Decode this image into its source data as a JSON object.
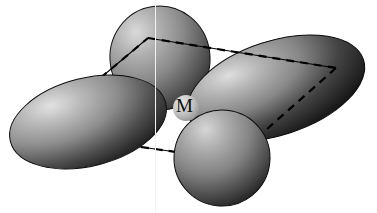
{
  "figure": {
    "kind": "3d-orbital-rendering",
    "background_color": "#ffffff",
    "center_atom_label": "M",
    "label_color": "#0d0d0d",
    "palette": {
      "lobe_highlight": "#d8d8d8",
      "lobe_midtone": "#8f8f8f",
      "lobe_shadow": "#2a2a2a",
      "lobe_deep_shadow": "#141414",
      "outline": "#000000",
      "dashed_line": "#000000",
      "solid_line": "#000000",
      "scanline": "#f2f2f2"
    },
    "lobes": [
      {
        "name": "lobe-left",
        "cx": 88,
        "cy": 122,
        "rx": 80,
        "ry": 44,
        "rotation": -14,
        "highlight_x": 52,
        "highlight_y": 98
      },
      {
        "name": "lobe-top",
        "cx": 160,
        "cy": 58,
        "rx": 50,
        "ry": 52,
        "rotation": -8,
        "highlight_x": 140,
        "highlight_y": 34
      },
      {
        "name": "lobe-right",
        "cx": 276,
        "cy": 88,
        "rx": 92,
        "ry": 47,
        "rotation": -18,
        "highlight_x": 236,
        "highlight_y": 64
      },
      {
        "name": "lobe-bottom",
        "cx": 222,
        "cy": 158,
        "rx": 48,
        "ry": 48,
        "rotation": 6,
        "highlight_x": 200,
        "highlight_y": 134
      }
    ],
    "center_sphere": {
      "name": "metal-center",
      "cx": 186,
      "cy": 108,
      "r": 13,
      "fill": "#bdbdbd"
    },
    "parallelogram": {
      "style": "dashed",
      "stroke_width": 2.2,
      "dash_pattern": "8 6",
      "vertices": [
        {
          "name": "vertex-top",
          "x": 148,
          "y": 38
        },
        {
          "name": "vertex-right",
          "x": 336,
          "y": 68
        },
        {
          "name": "vertex-bottom",
          "x": 232,
          "y": 160
        },
        {
          "name": "vertex-left",
          "x": 36,
          "y": 132
        }
      ]
    },
    "solid_lines": [
      {
        "name": "solid-edge-top-right",
        "x1": 148,
        "y1": 38,
        "x2": 336,
        "y2": 68
      },
      {
        "name": "solid-edge-top-left",
        "x1": 148,
        "y1": 38,
        "x2": 36,
        "y2": 132
      },
      {
        "name": "solid-edge-bottom",
        "x1": 36,
        "y1": 132,
        "x2": 232,
        "y2": 160
      }
    ],
    "scanlines": [
      {
        "name": "scanline-artifact",
        "x": 155
      }
    ]
  }
}
